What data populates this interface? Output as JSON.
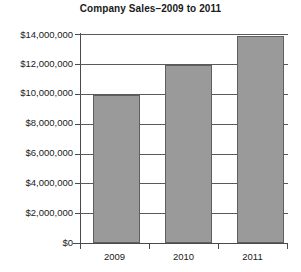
{
  "chart_data": {
    "type": "bar",
    "title": "Company Sales–2009 to 2011",
    "xlabel": "",
    "ylabel": "",
    "categories": [
      "2009",
      "2010",
      "2011"
    ],
    "values": [
      9900000,
      11900000,
      13850000
    ],
    "series": [
      {
        "name": "Company Sales",
        "values": [
          9900000,
          11900000,
          13850000
        ]
      }
    ],
    "ylim": [
      0,
      14000000
    ],
    "ytick_values": [
      0,
      2000000,
      4000000,
      6000000,
      8000000,
      10000000,
      12000000,
      14000000
    ],
    "ytick_labels": [
      "$0",
      "$2,000,000",
      "$4,000,000",
      "$6,000,000",
      "$8,000,000",
      "$10,000,000",
      "$12,000,000",
      "$14,000,000"
    ],
    "grid": true,
    "legend": false,
    "legend_position": "none",
    "bar_color": "#9a9a9a",
    "bar_edge_color": "#5f5f5f",
    "axis_color": "#4a4a4a",
    "background_color": "#ffffff",
    "text_color": "#1a1a1a"
  }
}
